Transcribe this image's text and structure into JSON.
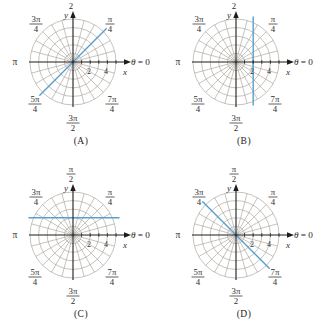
{
  "figure": {
    "background": "#ffffff",
    "grid_color": "#a8a39a",
    "axis_color": "#1d1d1b",
    "label_color": "#2e2e2e",
    "blue_line_color": "#57a0d0"
  },
  "shared_labels": {
    "pole_axis_right": "θ = 0",
    "theta": "θ",
    "equals_zero": " = 0",
    "left": "π",
    "upper_left": {
      "num": "3π",
      "den": "4"
    },
    "upper_right": {
      "num": "π",
      "den": "4"
    },
    "lower_left": {
      "num": "5π",
      "den": "4"
    },
    "lower_right": {
      "num": "7π",
      "den": "4"
    },
    "bottom": {
      "num": "3π",
      "den": "2"
    },
    "top_full": {
      "num": "π",
      "den": "2"
    },
    "top_partial": "2",
    "x_axis": "x",
    "y_axis": "y",
    "x_ticks": [
      "2",
      "4"
    ]
  },
  "polar_grid": {
    "circle_radii": [
      1,
      2,
      3,
      4,
      5
    ],
    "spoke_step_deg": 15,
    "x_tick_values": [
      2,
      4
    ]
  },
  "chart_data": [
    {
      "type": "line",
      "panel_label": "(A)",
      "coordinate_system": "polar-grid",
      "blue_line": {
        "form": "through-origin",
        "angle_deg": 45,
        "from_direction": "5π/4",
        "to_direction": "π/4"
      }
    },
    {
      "type": "line",
      "panel_label": "(B)",
      "coordinate_system": "polar-grid",
      "blue_line": {
        "form": "vertical",
        "x": 2
      }
    },
    {
      "type": "line",
      "panel_label": "(C)",
      "coordinate_system": "polar-grid",
      "blue_line": {
        "form": "horizontal",
        "y": 2
      }
    },
    {
      "type": "line",
      "panel_label": "(D)",
      "coordinate_system": "polar-grid",
      "blue_line": {
        "form": "through-origin",
        "angle_deg": 135,
        "from_direction": "3π/4",
        "to_direction": "7π/4"
      }
    }
  ]
}
